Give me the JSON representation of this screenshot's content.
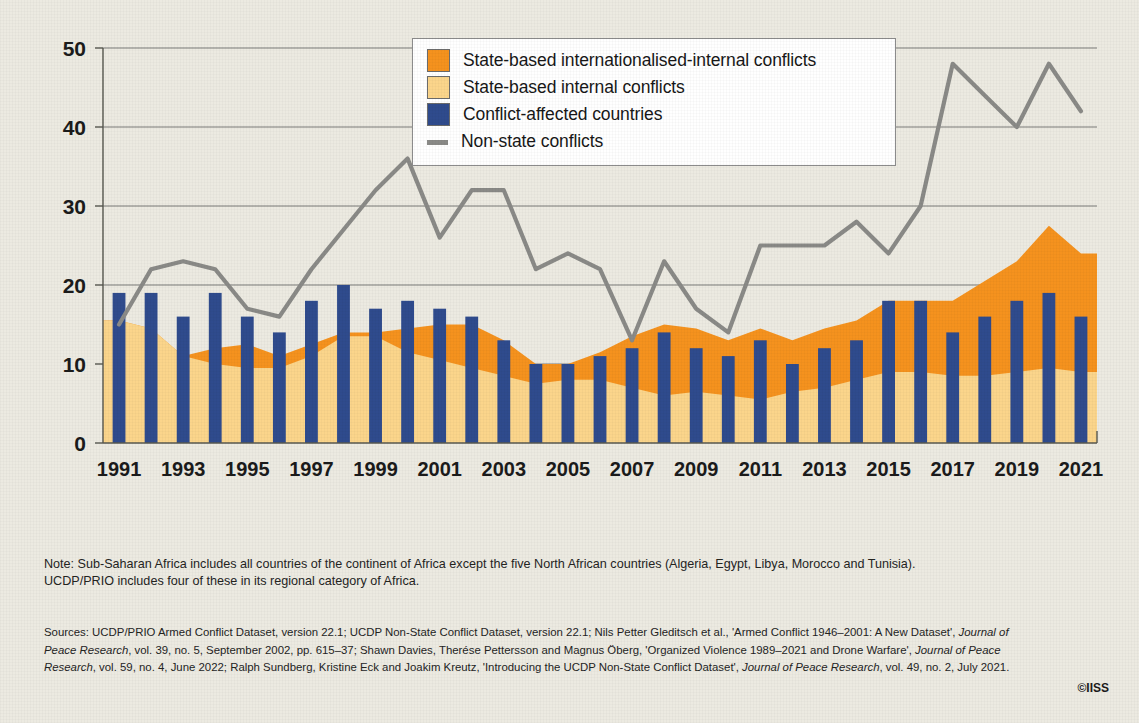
{
  "legend": {
    "items": [
      {
        "label": "State-based internationalised-internal conflicts",
        "marker": "square-swatch",
        "color": "#F5921E"
      },
      {
        "label": "State-based internal conflicts",
        "marker": "square-swatch",
        "color": "#FBD58B"
      },
      {
        "label": "Conflict-affected countries",
        "marker": "square-swatch",
        "color": "#2F4B8D"
      },
      {
        "label": "Non-state conflicts",
        "marker": "line-swatch",
        "color": "#8A8A87"
      }
    ]
  },
  "note": {
    "line1": "Note: Sub-Saharan Africa includes all countries of the continent of Africa except the five North African countries (Algeria, Egypt, Libya, Morocco and Tunisia).",
    "line2": "UCDP/PRIO includes four of these in its regional category of Africa."
  },
  "sources": {
    "l1a": "Sources: UCDP/PRIO Armed Conflict Dataset, version 22.1; UCDP Non-State Conflict Dataset, version 22.1; Nils Petter Gleditsch et al., ",
    "l1b": "'Armed Conflict 1946–2001: A New Dataset', ",
    "l1c": "Journal of",
    "l2a": "Peace Research",
    "l2b": ", vol. 39, no. 5, September 2002, pp. 615–37; Shawn Davies, Therése Pettersson and Magnus Öberg, 'Organized Violence 1989–2021 and Drone Warfare', ",
    "l2c": "Journal of Peace",
    "l3a": "Research",
    "l3b": ", vol. 59, no. 4, June 2022; Ralph Sundberg, Kristine Eck and Joakim Kreutz, 'Introducing the UCDP Non-State Conflict Dataset', ",
    "l3c": "Journal of Peace Research",
    "l3d": ", vol. 49, no. 2, July 2021."
  },
  "copyright": "©IISS",
  "chart_data": {
    "type": "bar",
    "title": "",
    "xlabel": "",
    "ylabel": "",
    "ylim": [
      0,
      50
    ],
    "yticks": [
      0,
      10,
      20,
      30,
      40,
      50
    ],
    "grid": true,
    "legend_position": "top-center",
    "x": [
      1991,
      1992,
      1993,
      1994,
      1995,
      1996,
      1997,
      1998,
      1999,
      2000,
      2001,
      2002,
      2003,
      2004,
      2005,
      2006,
      2007,
      2008,
      2009,
      2010,
      2011,
      2012,
      2013,
      2014,
      2015,
      2016,
      2017,
      2018,
      2019,
      2020,
      2021
    ],
    "xtick_labels": [
      "1991",
      "1993",
      "1995",
      "1997",
      "1999",
      "2001",
      "2003",
      "2005",
      "2007",
      "2009",
      "2011",
      "2013",
      "2015",
      "2017",
      "2019",
      "2021"
    ],
    "series": [
      {
        "name": "Conflict-affected countries",
        "render": "bar",
        "color": "#2F4B8D",
        "values": [
          19,
          19,
          16,
          19,
          16,
          14,
          18,
          20,
          17,
          18,
          17,
          16,
          13,
          10,
          10,
          11,
          12,
          14,
          12,
          11,
          13,
          10,
          12,
          13,
          18,
          18,
          14,
          16,
          18,
          19,
          16
        ]
      },
      {
        "name": "State-based internal conflicts",
        "render": "area",
        "color": "#FBD58B",
        "values": [
          15.5,
          14.5,
          11,
          10,
          9.5,
          9.5,
          11,
          13.5,
          13.5,
          11.5,
          10.5,
          9.5,
          8.5,
          7.5,
          8,
          8,
          7,
          6,
          6.5,
          6,
          5.5,
          6.5,
          7,
          8,
          9,
          9,
          8.5,
          8.5,
          9,
          9.5,
          9
        ]
      },
      {
        "name": "State-based internationalised-internal conflicts",
        "render": "area",
        "color": "#F5921E",
        "values": [
          15.5,
          14.5,
          11,
          12,
          12.5,
          11,
          12.5,
          14,
          14,
          14.5,
          15,
          15,
          13,
          10,
          10,
          11.5,
          13.5,
          15,
          14.5,
          13,
          14.5,
          13,
          14.5,
          15.5,
          18,
          18,
          18,
          20.5,
          23,
          27.5,
          24
        ]
      },
      {
        "name": "Non-state conflicts",
        "render": "line",
        "color": "#8A8A87",
        "values": [
          15,
          22,
          23,
          22,
          17,
          16,
          22,
          27,
          32,
          36,
          26,
          32,
          32,
          22,
          24,
          22,
          13,
          23,
          17,
          14,
          25,
          25,
          25,
          28,
          24,
          30,
          48,
          44,
          40,
          48,
          42
        ]
      }
    ]
  }
}
